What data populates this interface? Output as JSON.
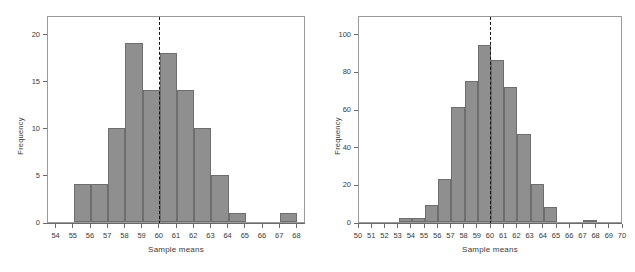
{
  "figure": {
    "background": "#ffffff",
    "bar_fill": "#8f8f8f",
    "bar_stroke": "#6e6e6e",
    "axis_color": "#6a6a6a",
    "mean_line_color": "#151515"
  },
  "chart_data": [
    {
      "type": "bar",
      "subtype": "histogram",
      "title": "",
      "xlabel": "Sample means",
      "ylabel": "Frequency",
      "xlim": [
        53.5,
        68.5
      ],
      "ylim": [
        0,
        22
      ],
      "xticks": [
        54,
        55,
        56,
        57,
        58,
        59,
        60,
        61,
        62,
        63,
        64,
        65,
        66,
        67,
        68
      ],
      "yticks": [
        0,
        5,
        10,
        15,
        20
      ],
      "grid": false,
      "legend": "none",
      "bin_edges": [
        54,
        55,
        56,
        57,
        58,
        59,
        60,
        61,
        62,
        63,
        64,
        65,
        66,
        67,
        68
      ],
      "categories": [
        "54-55",
        "55-56",
        "56-57",
        "57-58",
        "58-59",
        "59-60",
        "60-61",
        "61-62",
        "62-63",
        "63-64",
        "64-65",
        "65-66",
        "66-67",
        "67-68"
      ],
      "values": [
        0,
        4,
        4,
        10,
        19,
        14,
        18,
        14,
        10,
        5,
        1,
        0,
        0,
        1
      ],
      "annotations": [
        {
          "type": "vline",
          "label": "mean",
          "x": 60,
          "style": "dashed",
          "color": "#151515"
        }
      ]
    },
    {
      "type": "bar",
      "subtype": "histogram",
      "title": "",
      "xlabel": "Sample means",
      "ylabel": "Frequency",
      "xlim": [
        50,
        70
      ],
      "ylim": [
        0,
        110
      ],
      "xticks": [
        50,
        51,
        52,
        53,
        54,
        55,
        56,
        57,
        58,
        59,
        60,
        61,
        62,
        63,
        64,
        65,
        66,
        67,
        68,
        69,
        70
      ],
      "yticks": [
        0,
        20,
        40,
        60,
        80,
        100
      ],
      "grid": false,
      "legend": "none",
      "bin_edges": [
        50,
        51,
        52,
        53,
        54,
        55,
        56,
        57,
        58,
        59,
        60,
        61,
        62,
        63,
        64,
        65,
        66,
        67,
        68,
        69,
        70
      ],
      "categories": [
        "50-51",
        "51-52",
        "52-53",
        "53-54",
        "54-55",
        "55-56",
        "56-57",
        "57-58",
        "58-59",
        "59-60",
        "60-61",
        "61-62",
        "62-63",
        "63-64",
        "64-65",
        "65-66",
        "66-67",
        "67-68",
        "68-69",
        "69-70"
      ],
      "values": [
        0,
        0,
        0,
        2,
        2,
        9,
        23,
        61,
        75,
        94,
        86,
        72,
        47,
        20,
        8,
        0,
        0,
        1,
        0,
        0
      ],
      "annotations": [
        {
          "type": "vline",
          "label": "mean",
          "x": 60,
          "style": "dashed",
          "color": "#151515"
        }
      ]
    }
  ]
}
